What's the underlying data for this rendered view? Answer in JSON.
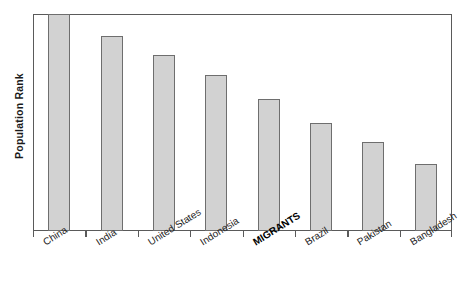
{
  "chart_data": {
    "type": "bar",
    "title": "",
    "xlabel": "",
    "ylabel": "Population Rank",
    "grid": false,
    "legend": false,
    "axis_tick_labels": [],
    "categories": [
      "China",
      "India",
      "United States",
      "Indonesia",
      "MIGRANTS",
      "Brazil",
      "Pakistan",
      "Bangladesh"
    ],
    "values": [
      100,
      90,
      81,
      72,
      61,
      50,
      41,
      31
    ],
    "ylim": [
      0,
      100
    ],
    "highlight_category": "MIGRANTS",
    "bar_fill_color": "#d2d2d2",
    "bar_border_color": "#6e6e6e",
    "axis_color": "#5a5a5a",
    "text_color": "#222222"
  },
  "axis": {
    "y_title": "Population Rank"
  }
}
